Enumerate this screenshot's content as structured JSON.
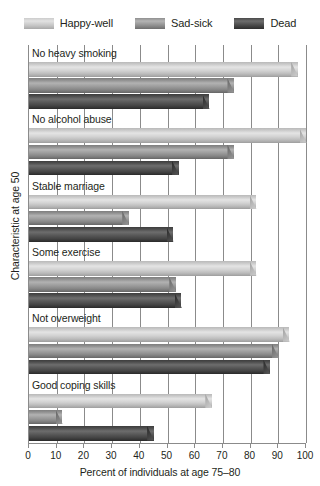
{
  "legend": {
    "items": [
      {
        "label": "Happy-well",
        "color": "#d2d2d2",
        "key": "happy"
      },
      {
        "label": "Sad-sick",
        "color": "#9b9b9b",
        "key": "sad"
      },
      {
        "label": "Dead",
        "color": "#3f3f3f",
        "key": "dead"
      }
    ]
  },
  "axes": {
    "x_title": "Percent of individuals at age 75–80",
    "y_title": "Characteristic at age 50",
    "x_ticklabels": [
      "0",
      "10",
      "20",
      "30",
      "40",
      "50",
      "60",
      "70",
      "80",
      "90",
      "100"
    ]
  },
  "chart_data": {
    "type": "bar",
    "orientation": "horizontal",
    "title": "",
    "xlabel": "Percent of individuals at age 75–80",
    "ylabel": "Characteristic at age 50",
    "xlim": [
      0,
      100
    ],
    "xticks": [
      0,
      10,
      20,
      30,
      40,
      50,
      60,
      70,
      80,
      90,
      100
    ],
    "grid": true,
    "legend_position": "top",
    "categories": [
      "No heavy smoking",
      "No alcohol abuse",
      "Stable marriage",
      "Some exercise",
      "Not overweight",
      "Good coping skills"
    ],
    "series": [
      {
        "name": "Happy-well",
        "color": "#d2d2d2",
        "values": [
          97,
          100,
          82,
          82,
          94,
          66
        ]
      },
      {
        "name": "Sad-sick",
        "color": "#9b9b9b",
        "values": [
          74,
          74,
          36,
          53,
          90,
          12
        ]
      },
      {
        "name": "Dead",
        "color": "#3f3f3f",
        "values": [
          65,
          54,
          52,
          55,
          87,
          45
        ]
      }
    ]
  }
}
